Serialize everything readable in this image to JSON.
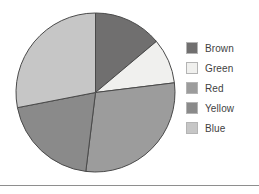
{
  "chart_data": {
    "type": "pie",
    "title": "",
    "categories": [
      "Brown",
      "Green",
      "Red",
      "Yellow",
      "Blue"
    ],
    "values": [
      13.9,
      9.2,
      28.9,
      20.0,
      28.0
    ],
    "unit": "percent",
    "start_angle_deg": 0,
    "direction": "clockwise",
    "slice_angles_deg": [
      50,
      33,
      104,
      72,
      101
    ],
    "slice_boundaries_deg": [
      0,
      50,
      83,
      187,
      259,
      360
    ],
    "legend_position": "right",
    "grid": false,
    "slices": [
      {
        "label": "Brown",
        "value": 13.9,
        "angle_deg": 50,
        "color": "#706f6f"
      },
      {
        "label": "Green",
        "value": 9.2,
        "angle_deg": 33,
        "color": "#f0f0ee"
      },
      {
        "label": "Red",
        "value": 28.9,
        "angle_deg": 104,
        "color": "#9c9c9c"
      },
      {
        "label": "Yellow",
        "value": 20.0,
        "angle_deg": 72,
        "color": "#8a8a8a"
      },
      {
        "label": "Blue",
        "value": 28.0,
        "angle_deg": 101,
        "color": "#c6c6c6"
      }
    ]
  },
  "legend": {
    "items": [
      {
        "label": "Brown",
        "color": "#706f6f"
      },
      {
        "label": "Green",
        "color": "#f0f0ee"
      },
      {
        "label": "Red",
        "color": "#9c9c9c"
      },
      {
        "label": "Yellow",
        "color": "#8a8a8a"
      },
      {
        "label": "Blue",
        "color": "#c6c6c6"
      }
    ]
  },
  "style": {
    "background": "#ffffff",
    "slice_outline": "#4a4a4a",
    "legend_text": "#3f3f3f",
    "rule_color": "#8e8e8e"
  }
}
